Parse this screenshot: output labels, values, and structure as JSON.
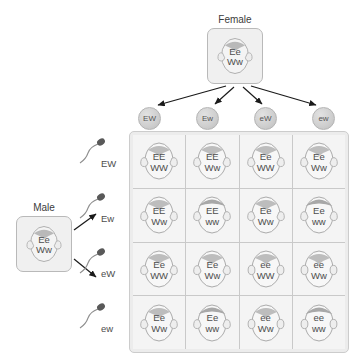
{
  "diagram": {
    "female": {
      "label": "Female",
      "genotype_line1": "Ee",
      "genotype_line2": "Ww",
      "icon": "female-face-icon"
    },
    "male": {
      "label": "Male",
      "genotype_line1": "Ee",
      "genotype_line2": "Ww",
      "icon": "male-face-icon"
    },
    "egg_gametes": [
      {
        "label": "EW",
        "icon": "egg-icon"
      },
      {
        "label": "Ew",
        "icon": "egg-icon"
      },
      {
        "label": "eW",
        "icon": "egg-icon"
      },
      {
        "label": "ew",
        "icon": "egg-icon"
      }
    ],
    "sperm_gametes": [
      {
        "label": "EW",
        "icon": "sperm-icon"
      },
      {
        "label": "Ew",
        "icon": "sperm-icon"
      },
      {
        "label": "eW",
        "icon": "sperm-icon"
      },
      {
        "label": "ew",
        "icon": "sperm-icon"
      }
    ],
    "offspring": [
      {
        "ear": "EE",
        "hair": "WW",
        "free_ears": true,
        "widows_peak": true
      },
      {
        "ear": "EE",
        "hair": "Ww",
        "free_ears": true,
        "widows_peak": true
      },
      {
        "ear": "Ee",
        "hair": "WW",
        "free_ears": true,
        "widows_peak": true
      },
      {
        "ear": "Ee",
        "hair": "Ww",
        "free_ears": true,
        "widows_peak": true
      },
      {
        "ear": "EE",
        "hair": "Ww",
        "free_ears": true,
        "widows_peak": true
      },
      {
        "ear": "EE",
        "hair": "ww",
        "free_ears": true,
        "widows_peak": false
      },
      {
        "ear": "Ee",
        "hair": "Ww",
        "free_ears": true,
        "widows_peak": true
      },
      {
        "ear": "Ee",
        "hair": "ww",
        "free_ears": true,
        "widows_peak": false
      },
      {
        "ear": "Ee",
        "hair": "WW",
        "free_ears": true,
        "widows_peak": true
      },
      {
        "ear": "Ee",
        "hair": "Ww",
        "free_ears": true,
        "widows_peak": true
      },
      {
        "ear": "ee",
        "hair": "WW",
        "free_ears": false,
        "widows_peak": true
      },
      {
        "ear": "ee",
        "hair": "Ww",
        "free_ears": false,
        "widows_peak": true
      },
      {
        "ear": "Ee",
        "hair": "Ww",
        "free_ears": true,
        "widows_peak": true
      },
      {
        "ear": "Ee",
        "hair": "ww",
        "free_ears": true,
        "widows_peak": false
      },
      {
        "ear": "ee",
        "hair": "Ww",
        "free_ears": false,
        "widows_peak": true
      },
      {
        "ear": "ee",
        "hair": "ww",
        "free_ears": false,
        "widows_peak": false
      }
    ],
    "colors": {
      "background": "#ffffff",
      "panel": "#ececec",
      "cell": "#f4f4f4",
      "border": "#c9c9c9",
      "text": "#4d4d4d",
      "arrow": "#1a1a1a"
    }
  }
}
